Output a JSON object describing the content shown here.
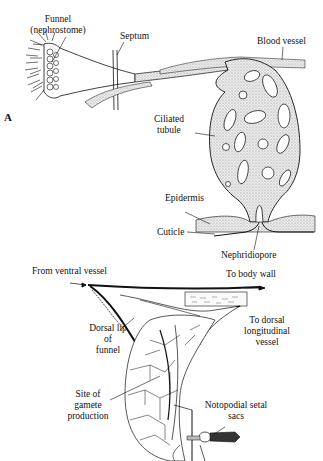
{
  "figure_a": {
    "panel_label": "A",
    "labels": {
      "funnel_line1": "Funnel",
      "funnel_line2": "(nephrostome)",
      "septum": "Septum",
      "blood_vessel": "Blood vessel",
      "ciliated_line1": "Ciliated",
      "ciliated_line2": "tubule",
      "epidermis": "Epidermis",
      "cuticle": "Cuticle",
      "nephridiopore": "Nephridiopore"
    }
  },
  "figure_b": {
    "labels": {
      "from_ventral": "From ventral vessel",
      "to_body_wall": "To body wall",
      "to_dorsal_line1": "To dorsal",
      "to_dorsal_line2": "longitudinal",
      "to_dorsal_line3": "vessel",
      "dorsal_lip_line1": "Dorsal lip",
      "dorsal_lip_line2": "of",
      "dorsal_lip_line3": "funnel",
      "site_line1": "Site of",
      "site_line2": "gamete",
      "site_line3": "production",
      "notopodial_line1": "Notopodial setal",
      "notopodial_line2": "sacs"
    }
  },
  "colors": {
    "ink": "#111111",
    "stipple": "#cfcfcf",
    "background": "#ffffff"
  }
}
